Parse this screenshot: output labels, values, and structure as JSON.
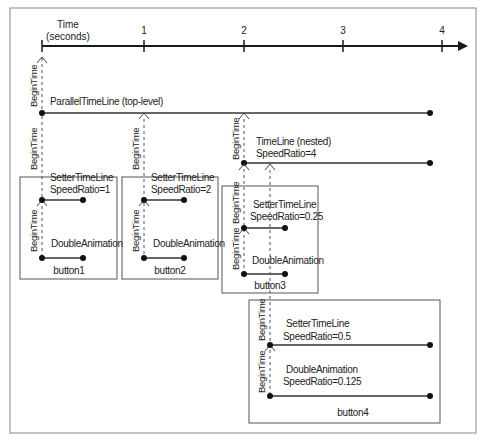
{
  "axis": {
    "title_line1": "Time",
    "title_line2": "(seconds)",
    "ticks": [
      "1",
      "2",
      "3",
      "4"
    ]
  },
  "begin_time_label": "BeginTime",
  "timelines": {
    "parallel": {
      "label": "ParallelTimeLine (top-level)"
    },
    "nested": {
      "label_line1": "TimeLine (nested)",
      "label_line2": "SpeedRatio=4"
    }
  },
  "boxes": [
    {
      "name": "button1",
      "setter": {
        "label_line1": "SetterTimeLine",
        "label_line2": "SpeedRatio=1"
      },
      "animation": {
        "label_line1": "DoubleAnimation",
        "label_line2": ""
      }
    },
    {
      "name": "button2",
      "setter": {
        "label_line1": "SetterTimeLine",
        "label_line2": "SpeedRatio=2"
      },
      "animation": {
        "label_line1": "DoubleAnimation",
        "label_line2": ""
      }
    },
    {
      "name": "button3",
      "setter": {
        "label_line1": "SetterTimeLine",
        "label_line2": "SpeedRatio=0.25"
      },
      "animation": {
        "label_line1": "DoubleAnimation",
        "label_line2": ""
      }
    },
    {
      "name": "button4",
      "setter": {
        "label_line1": "SetterTimeLine",
        "label_line2": "SpeedRatio=0.5"
      },
      "animation": {
        "label_line1": "DoubleAnimation",
        "label_line2": "SpeedRatio=0.125"
      }
    }
  ],
  "colors": {
    "line": "#333333",
    "frame": "#9a9a9a",
    "box": "#555555",
    "background": "#ffffff"
  }
}
